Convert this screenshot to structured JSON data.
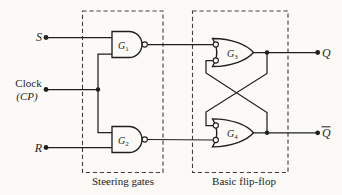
{
  "figure": {
    "inputs": {
      "s_label": "S",
      "clock_label": "Clock",
      "clock_symbol": "(CP)",
      "r_label": "R"
    },
    "gates": {
      "g1": {
        "base": "G",
        "sub": "1"
      },
      "g2": {
        "base": "G",
        "sub": "2"
      },
      "g3": {
        "base": "G",
        "sub": "3"
      },
      "g4": {
        "base": "G",
        "sub": "4"
      }
    },
    "outputs": {
      "q_label": "Q",
      "q_bar_label": "Q",
      "q_bar_has_overline": true
    },
    "captions": {
      "steering": "Steering gates",
      "flipflop": "Basic flip-flop"
    },
    "colors": {
      "background": "#fbfaf6",
      "line": "#1f1f1f",
      "dashed_box": "#3f3f3f"
    }
  }
}
